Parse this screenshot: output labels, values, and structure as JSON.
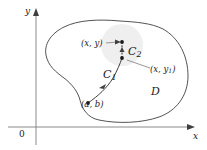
{
  "figure": {
    "type": "math-diagram",
    "background_color": "#ffffff",
    "stroke_color": "#3f3f3f",
    "shade_color": "#eeeeee",
    "axes": {
      "x_label": "x",
      "y_label": "y",
      "origin_label": "0"
    },
    "region": {
      "label": "D"
    },
    "curves": [
      {
        "name": "curve-c1",
        "label": "C",
        "subscript": "1"
      },
      {
        "name": "curve-c2",
        "label": "C",
        "subscript": "2"
      }
    ],
    "points": [
      {
        "name": "point-xy",
        "label": "(x, y)",
        "subscript": ""
      },
      {
        "name": "point-xy1",
        "label": "(x, y",
        "subscript": "1",
        "label_tail": ")"
      },
      {
        "name": "point-ab",
        "label": "(a, b)",
        "subscript": ""
      }
    ]
  }
}
